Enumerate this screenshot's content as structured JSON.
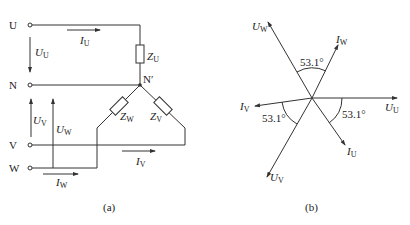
{
  "figure_a": {
    "caption": "(a)",
    "terminals": [
      {
        "id": "U",
        "label": "U"
      },
      {
        "id": "N",
        "label": "N"
      },
      {
        "id": "V",
        "label": "V"
      },
      {
        "id": "W",
        "label": "W"
      }
    ],
    "neutral_point": "N′",
    "impedances": [
      {
        "label": "Z",
        "sub": "U"
      },
      {
        "label": "Z",
        "sub": "W"
      },
      {
        "label": "Z",
        "sub": "V"
      }
    ],
    "voltages": [
      {
        "label": "U",
        "sub": "U"
      },
      {
        "label": "U",
        "sub": "V"
      },
      {
        "label": "U",
        "sub": "W"
      }
    ],
    "currents": [
      {
        "label": "I",
        "sub": "U"
      },
      {
        "label": "I",
        "sub": "V"
      },
      {
        "label": "I",
        "sub": "W"
      }
    ]
  },
  "figure_b": {
    "caption": "(b)",
    "phasors": [
      {
        "label": "U",
        "sub": "U",
        "angle_deg": 0
      },
      {
        "label": "I",
        "sub": "U",
        "angle_deg": -53.1
      },
      {
        "label": "U",
        "sub": "V",
        "angle_deg": -120
      },
      {
        "label": "I",
        "sub": "V",
        "angle_deg": 186.9
      },
      {
        "label": "U",
        "sub": "W",
        "angle_deg": 120
      },
      {
        "label": "I",
        "sub": "W",
        "angle_deg": 66.9
      }
    ],
    "angle_labels": [
      "53.1°",
      "53.1°",
      "53.1°"
    ]
  }
}
